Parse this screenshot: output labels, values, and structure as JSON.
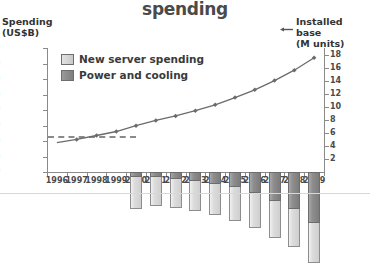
{
  "header": {
    "title": "spending"
  },
  "axes": {
    "left_title_line1": "Spending",
    "left_title_line2": "(US$B)",
    "right_title_line1": "Installed base",
    "right_title_line2": "(M units)",
    "installed_base_marker_icon": "left-arrow-line-icon"
  },
  "legend": {
    "items": [
      {
        "label": "New server spending",
        "color": "#d8d8d8",
        "swatch": "sw-new"
      },
      {
        "label": "Power and cooling",
        "color": "#8b8b8b",
        "swatch": "sw-power"
      }
    ]
  },
  "chart_data": {
    "type": "bar",
    "title": "spending",
    "xlabel": "",
    "ylabel": "Spending (US$B)",
    "y2label": "Installed base (M units)",
    "grid": false,
    "legend_position": "top-left",
    "categories": [
      "1996",
      "1997",
      "1998",
      "1999",
      "2000",
      "2001",
      "2002",
      "2003",
      "2004",
      "2005",
      "2006",
      "2007",
      "2008",
      "2009"
    ],
    "ylim": [
      0,
      80
    ],
    "ytick_labels": [
      "$0",
      "$10",
      "$20",
      "$30",
      "$40",
      "$50",
      "$60",
      "$70",
      "$80"
    ],
    "ytick_values": [
      0,
      10,
      20,
      30,
      40,
      50,
      60,
      70,
      80
    ],
    "y2lim": [
      0,
      19
    ],
    "y2tick_labels": [
      "2",
      "4",
      "6",
      "8",
      "10",
      "12",
      "14",
      "16",
      "18"
    ],
    "y2tick_values": [
      2,
      4,
      6,
      8,
      10,
      12,
      14,
      16,
      18
    ],
    "series": [
      {
        "name": "New server spending",
        "type": "bar",
        "stack": "spending",
        "color": "#d8d8d8",
        "values": [
          null,
          null,
          null,
          null,
          21.0,
          18.5,
          19.0,
          19.5,
          20.5,
          21.5,
          22.5,
          23.5,
          24.5,
          25.5
        ]
      },
      {
        "name": "Power and cooling",
        "type": "bar",
        "stack": "spending",
        "color": "#8b8b8b",
        "values": [
          null,
          null,
          null,
          null,
          3.0,
          3.5,
          4.5,
          5.5,
          7.5,
          10.0,
          13.5,
          19.0,
          24.0,
          33.0
        ]
      },
      {
        "name": "Installed base",
        "type": "line",
        "axis": "y2",
        "color": "#6b6b6b",
        "values": [
          4.5,
          5.0,
          5.6,
          6.2,
          7.1,
          7.9,
          8.6,
          9.4,
          10.3,
          11.4,
          12.6,
          14.0,
          15.6,
          17.5
        ]
      }
    ],
    "annotations": [
      {
        "kind": "dashed-reference-line",
        "axis": "y2",
        "value": 5.5,
        "x_from": "1996",
        "x_to": "2000"
      }
    ]
  }
}
